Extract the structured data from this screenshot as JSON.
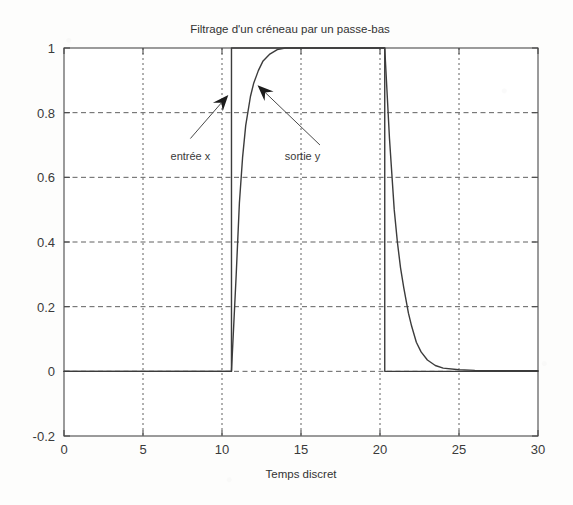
{
  "chart_data": {
    "type": "line",
    "title": "Filtrage d'un créneau par un passe-bas",
    "xlabel": "Temps discret",
    "ylabel": "",
    "xlim": [
      0,
      30
    ],
    "ylim": [
      -0.2,
      1.0
    ],
    "grid": true,
    "grid_style": "dashed",
    "legend": "none",
    "xticks": [
      0,
      5,
      10,
      15,
      20,
      25,
      30
    ],
    "xtick_labels": [
      "0",
      "5",
      "10",
      "15",
      "20",
      "25",
      "30"
    ],
    "yticks": [
      -0.2,
      0,
      0.2,
      0.4,
      0.6,
      0.8,
      1
    ],
    "ytick_labels": [
      "-0.2",
      "0",
      "0.2",
      "0.4",
      "0.6",
      "0.8",
      "1"
    ],
    "line_color": "#3c3c3c",
    "background_color": "#fdfdfc",
    "series": [
      {
        "name": "entrée x",
        "description": "Signal carré d'entrée (créneau), transition montante à t=10.6 et descendante à t=20.3",
        "x": [
          0,
          1,
          2,
          3,
          4,
          5,
          6,
          7,
          8,
          9,
          10,
          10.6,
          10.6,
          11,
          12,
          13,
          14,
          15,
          16,
          17,
          18,
          19,
          20,
          20.3,
          20.3,
          21,
          22,
          23,
          24,
          25,
          26,
          27,
          28,
          29,
          30
        ],
        "y": [
          0,
          0,
          0,
          0,
          0,
          0,
          0,
          0,
          0,
          0,
          0,
          0,
          1,
          1,
          1,
          1,
          1,
          1,
          1,
          1,
          1,
          1,
          1,
          1,
          0,
          0,
          0,
          0,
          0,
          0,
          0,
          0,
          0,
          0,
          0
        ]
      },
      {
        "name": "sortie y",
        "description": "Sortie filtrée par le passe-bas : montée exponentielle puis décroissance exponentielle",
        "x": [
          0,
          2,
          4,
          6,
          8,
          10,
          10.6,
          10.9,
          11.1,
          11.3,
          11.5,
          11.8,
          12.0,
          12.3,
          12.6,
          13.0,
          13.5,
          14,
          15,
          16,
          17,
          18,
          19,
          20,
          20.3,
          20.6,
          20.9,
          21.1,
          21.3,
          21.5,
          21.8,
          22.0,
          22.3,
          22.6,
          23.0,
          23.5,
          24,
          25,
          26,
          28,
          30
        ],
        "y": [
          0,
          0,
          0,
          0,
          0,
          0,
          0,
          0.3,
          0.52,
          0.66,
          0.76,
          0.85,
          0.89,
          0.93,
          0.96,
          0.98,
          0.995,
          1.0,
          1.0,
          1.0,
          1.0,
          1.0,
          1.0,
          1.0,
          1.0,
          0.72,
          0.5,
          0.4,
          0.32,
          0.26,
          0.18,
          0.14,
          0.09,
          0.06,
          0.035,
          0.018,
          0.01,
          0.005,
          0.003,
          0.002,
          0.002
        ]
      }
    ],
    "annotations": [
      {
        "label": "entrée x",
        "label_x": 8.0,
        "label_y": 0.655,
        "arrow_from_x": 8.0,
        "arrow_from_y": 0.72,
        "arrow_to_x": 10.4,
        "arrow_to_y": 0.855
      },
      {
        "label": "sortie y",
        "label_x": 15.1,
        "label_y": 0.655,
        "arrow_from_x": 16.2,
        "arrow_from_y": 0.7,
        "arrow_to_x": 12.25,
        "arrow_to_y": 0.885
      }
    ]
  }
}
